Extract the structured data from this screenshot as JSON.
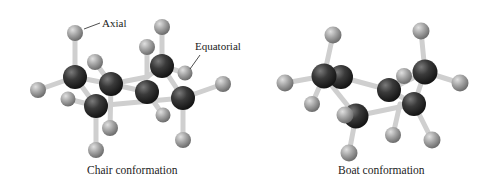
{
  "figure": {
    "panels": [
      {
        "id": "chair",
        "caption": "Chair conformation",
        "labels": [
          {
            "text": "Axial"
          },
          {
            "text": "Equatorial"
          }
        ]
      },
      {
        "id": "boat",
        "caption": "Boat conformation"
      }
    ],
    "colors": {
      "carbon": "#2e2e2e",
      "hydrogen": "#9a9a9a",
      "bond": "#c8c8c8",
      "text": "#222222"
    },
    "legend_atoms": {
      "carbon": "carbon-atom",
      "hydrogen": "hydrogen-atom"
    }
  }
}
